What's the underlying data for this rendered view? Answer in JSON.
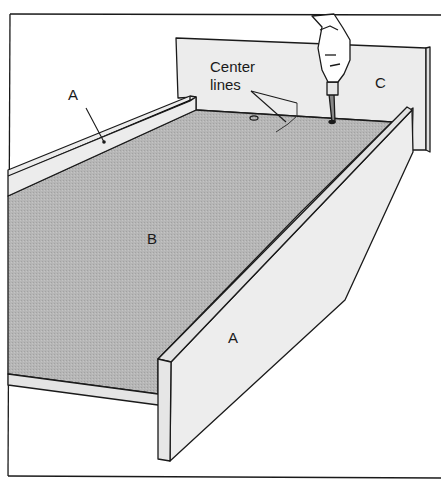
{
  "figure": {
    "labels": {
      "left_rail": "A",
      "base": "B",
      "end_panel": "C",
      "front_rail": "A",
      "center_lines_line1": "Center",
      "center_lines_line2": "lines"
    },
    "colors": {
      "line": "#1a1a1a",
      "board_light": "#ececec",
      "base_gray": "#b4b4b4",
      "background": "#ffffff"
    }
  }
}
